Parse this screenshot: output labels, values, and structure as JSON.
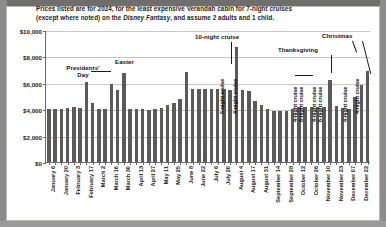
{
  "chart_data": {
    "type": "bar",
    "title": "Prices listed are for 2024, for the least expensive Verandah cabin for 7-night cruises (except where noted) on the Disney Fantasy, and assume 2 adults and 1 child.",
    "title_line1_a": "Prices listed are for 2024, for the least expensive Verandah cabin for 7-night cruises",
    "title_line2_a": "(except where noted) on the ",
    "title_italic": "Disney Fantasy",
    "title_line2_b": ", and assume 2 adults and 1 child.",
    "xlabel": "",
    "ylabel": "",
    "ylim": [
      0,
      10000
    ],
    "ytick_values": [
      0,
      2000,
      4000,
      6000,
      8000,
      10000
    ],
    "ytick_labels": [
      "$0",
      "$2,000",
      "$4,000",
      "$6,000",
      "$8,000",
      "$10,000"
    ],
    "grid": true,
    "legend": "none",
    "bar_color": "#5b5a58",
    "categories": [
      "January 6",
      "January 13",
      "January 20",
      "January 27",
      "February 3",
      "February 10",
      "February 17",
      "February 24",
      "March 2",
      "March 9",
      "March 16",
      "March 23",
      "March 30",
      "April 6",
      "April 13",
      "April 20",
      "April 27",
      "May 4",
      "May 11",
      "May 18",
      "May 25",
      "June 1",
      "June 8",
      "June 15",
      "June 22",
      "June 29",
      "July 6",
      "July 13",
      "July 20",
      "July 27",
      "August 4",
      "August 10",
      "August 17",
      "August 24",
      "August 31",
      "September 7",
      "September 14",
      "September 21",
      "September 28",
      "October 5",
      "October 12",
      "October 19",
      "October 26",
      "November 2",
      "November 10",
      "November 16",
      "November 23",
      "November 30",
      "December 07",
      "December 14",
      "December 22",
      "December 29"
    ],
    "values": [
      4050,
      3980,
      4020,
      4080,
      4200,
      4100,
      6050,
      4450,
      4020,
      4050,
      5900,
      5450,
      6750,
      4020,
      3980,
      4000,
      3960,
      4010,
      4060,
      4300,
      4500,
      4750,
      6800,
      5500,
      5500,
      5500,
      5500,
      5500,
      5500,
      5450,
      8700,
      5450,
      5400,
      4600,
      4350,
      4000,
      3880,
      3880,
      3900,
      3980,
      4200,
      4200,
      4200,
      4200,
      4150,
      6200,
      4250,
      4100,
      4050,
      4900,
      5800,
      6900
    ],
    "xtick_labels": [
      "January 6",
      "January 20",
      "February 3",
      "February 17",
      "March 2",
      "March 16",
      "March 30",
      "April 13",
      "April 27",
      "May 11",
      "May 25",
      "June 8",
      "June 22",
      "July 6",
      "July 20",
      "August 4",
      "August 17",
      "August 31",
      "September 14",
      "September 28",
      "October 12",
      "October 26",
      "November 10",
      "November 23",
      "December 07",
      "December 22"
    ],
    "annotations": [
      {
        "text": "Presidents' Day",
        "line1": "Presidents'",
        "line2": "Day",
        "orient": "horizontal"
      },
      {
        "text": "Easter",
        "orient": "horizontal"
      },
      {
        "text": "10-night cruise",
        "orient": "horizontal"
      },
      {
        "text": "Thanksgiving",
        "orient": "horizontal"
      },
      {
        "text": "Christmas",
        "orient": "horizontal"
      },
      {
        "text": "5-night cruise",
        "orient": "vertical"
      },
      {
        "text": "4-night cruise",
        "orient": "vertical"
      },
      {
        "text": "4-night cruise",
        "orient": "vertical"
      },
      {
        "text": "6-night cruise",
        "orient": "vertical"
      },
      {
        "text": "4-night cruise",
        "orient": "vertical"
      },
      {
        "text": "6-night cruise",
        "orient": "vertical"
      },
      {
        "text": "4-night cruise",
        "orient": "vertical"
      },
      {
        "text": "4-night cruise",
        "orient": "vertical"
      }
    ]
  },
  "annot": {
    "presidents_1": "Presidents'",
    "presidents_2": "Day",
    "easter": "Easter",
    "ten_night": "10-night cruise",
    "thanksgiving": "Thanksgiving",
    "christmas": "Christmas",
    "five_night": "5-night cruise",
    "four_night_a": "4-night cruise",
    "four_night_b": "4-night cruise",
    "six_night_a": "6-night cruise",
    "four_night_c": "4-night cruise",
    "six_night_b": "6-night cruise",
    "four_night_d": "4-night cruise",
    "four_night_e": "4-night cruise"
  }
}
